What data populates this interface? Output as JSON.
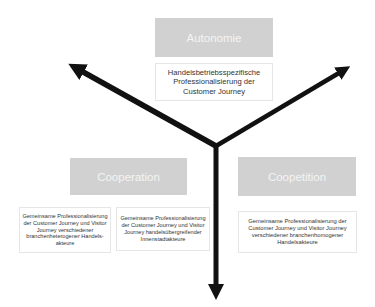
{
  "diagram": {
    "type": "three-way-axis",
    "center": {
      "x": 216,
      "y": 146
    },
    "arrow_color": "#111111",
    "header_box_color": "#d1d1d1",
    "header_text_color": "#f4f4f4",
    "axes": [
      {
        "id": "autonomie",
        "label": "Autonomie",
        "description": "Handelsbetriebsspezifische Professionalisierung der Customer Journey"
      },
      {
        "id": "cooperation",
        "label": "Cooperation",
        "descriptions": [
          "Gemeinsame Professionalisierung der Customer Journey und Visitor Journey verschiedener branchenheterogener Handels-akteure",
          "Gemeinsame Professionalisierung der Customer Journey und Visitor Journey handelsübergreifender Innenstadtakteure"
        ]
      },
      {
        "id": "coopetition",
        "label": "Coopetition",
        "description": "Gemeinsame Professionalisierung der Customer Journey und Visitor Journey verschiedener branchenhomogener Handelsakteure"
      }
    ]
  }
}
